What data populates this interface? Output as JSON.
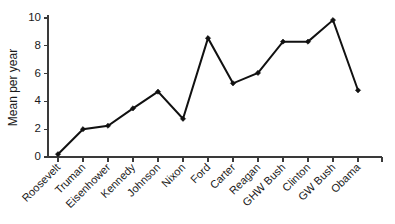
{
  "chart_data": {
    "type": "line",
    "title": "",
    "xlabel": "",
    "ylabel": "Mean per year",
    "ylim": [
      0,
      10
    ],
    "yticks": [
      0,
      2,
      4,
      6,
      8,
      10
    ],
    "ytick_labels": [
      "0",
      "2",
      "4",
      "6",
      "8",
      "10"
    ],
    "grid": false,
    "legend": null,
    "marker": "diamond",
    "line_color": "#111111",
    "axis_color": "#3a3a3a",
    "xtick_rotation": -45,
    "categories": [
      "Roosevelt",
      "Truman",
      "Eisenhower",
      "Kennedy",
      "Johnson",
      "Nixon",
      "Ford",
      "Carter",
      "Reagan",
      "GHW Bush",
      "Clinton",
      "GW Bush",
      "Obama"
    ],
    "values": [
      0.2,
      2.0,
      2.25,
      3.5,
      4.7,
      2.75,
      8.55,
      5.3,
      6.05,
      8.3,
      8.3,
      9.85,
      4.8
    ],
    "points": [
      {
        "label": "Roosevelt",
        "value": 0.2
      },
      {
        "label": "Truman",
        "value": 2.0
      },
      {
        "label": "Eisenhower",
        "value": 2.25
      },
      {
        "label": "Kennedy",
        "value": 3.5
      },
      {
        "label": "Johnson",
        "value": 4.7
      },
      {
        "label": "Nixon",
        "value": 2.75
      },
      {
        "label": "Ford",
        "value": 8.55
      },
      {
        "label": "Carter",
        "value": 5.3
      },
      {
        "label": "Reagan",
        "value": 6.05
      },
      {
        "label": "GHW Bush",
        "value": 8.3
      },
      {
        "label": "Clinton",
        "value": 8.3
      },
      {
        "label": "GW Bush",
        "value": 9.85
      },
      {
        "label": "Obama",
        "value": 4.8
      }
    ]
  }
}
